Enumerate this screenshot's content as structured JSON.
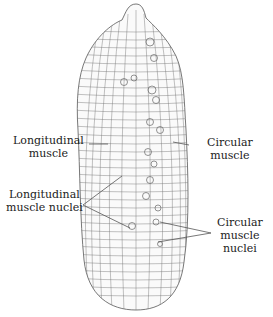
{
  "diagram": {
    "labels": {
      "longitudinal_muscle": [
        "Longitudinal",
        "muscle"
      ],
      "circular_muscle": [
        "Circular",
        "muscle"
      ],
      "longitudinal_muscle_nuclei": [
        "Longitudinal",
        "muscle nuclei"
      ],
      "circular_muscle_nuclei": [
        "Circular",
        "muscle",
        "nuclei"
      ]
    },
    "colors": {
      "line": "#555555",
      "text": "#222222",
      "background": "#ffffff"
    }
  }
}
